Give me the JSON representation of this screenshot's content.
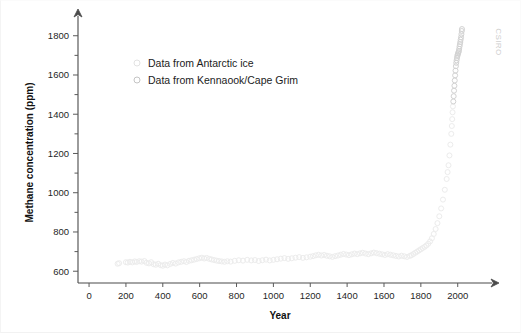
{
  "watermark": {
    "text": "CSIRO"
  },
  "legend": {
    "position": "upper-left-inside",
    "items": [
      {
        "label": "Data from Antarctic ice",
        "marker": "open-circle",
        "color": "#e2e2e2"
      },
      {
        "label": "Data from Kennaook/Cape Grim",
        "marker": "open-circle",
        "color": "#c4c4c4"
      }
    ]
  },
  "chart_data": {
    "type": "scatter",
    "title": "",
    "xlabel": "Year",
    "ylabel": "Methane concentration (ppm)",
    "xlim": [
      -60,
      2110
    ],
    "ylim": [
      540,
      1870
    ],
    "grid": false,
    "xticks": [
      0,
      200,
      400,
      600,
      800,
      1000,
      1200,
      1400,
      1600,
      1800,
      2000
    ],
    "xtick_labels": [
      "0",
      "200",
      "400",
      "600",
      "800",
      "1000",
      "1200",
      "1400",
      "1600",
      "1800",
      "2000"
    ],
    "yticks": [
      600,
      800,
      1000,
      1200,
      1400,
      1600,
      1800
    ],
    "ytick_labels": [
      "600",
      "800",
      "1000",
      "1200",
      "1400",
      "1600",
      "1800"
    ],
    "yminor_ticks": [
      700,
      900,
      1100,
      1300,
      1500,
      1700
    ],
    "axis_arrows": {
      "x": "right",
      "y": "up"
    },
    "series": [
      {
        "name": "Data from Antarctic ice",
        "marker": "open-circle",
        "color": "#ececec",
        "points": [
          [
            155,
            638
          ],
          [
            163,
            641
          ],
          [
            200,
            646
          ],
          [
            210,
            644
          ],
          [
            222,
            648
          ],
          [
            235,
            645
          ],
          [
            248,
            650
          ],
          [
            258,
            647
          ],
          [
            272,
            651
          ],
          [
            285,
            649
          ],
          [
            300,
            652
          ],
          [
            312,
            643
          ],
          [
            325,
            640
          ],
          [
            337,
            646
          ],
          [
            350,
            636
          ],
          [
            362,
            633
          ],
          [
            375,
            638
          ],
          [
            388,
            631
          ],
          [
            400,
            628
          ],
          [
            412,
            634
          ],
          [
            425,
            630
          ],
          [
            440,
            637
          ],
          [
            455,
            642
          ],
          [
            470,
            639
          ],
          [
            485,
            645
          ],
          [
            500,
            648
          ],
          [
            515,
            651
          ],
          [
            528,
            647
          ],
          [
            542,
            653
          ],
          [
            556,
            656
          ],
          [
            570,
            659
          ],
          [
            584,
            662
          ],
          [
            598,
            666
          ],
          [
            612,
            669
          ],
          [
            625,
            665
          ],
          [
            638,
            668
          ],
          [
            652,
            663
          ],
          [
            665,
            660
          ],
          [
            678,
            657
          ],
          [
            692,
            654
          ],
          [
            705,
            652
          ],
          [
            720,
            650
          ],
          [
            735,
            648
          ],
          [
            750,
            651
          ],
          [
            768,
            649
          ],
          [
            790,
            653
          ],
          [
            812,
            656
          ],
          [
            835,
            654
          ],
          [
            858,
            658
          ],
          [
            880,
            655
          ],
          [
            900,
            657
          ],
          [
            920,
            652
          ],
          [
            940,
            656
          ],
          [
            960,
            659
          ],
          [
            980,
            655
          ],
          [
            1000,
            658
          ],
          [
            1020,
            661
          ],
          [
            1040,
            664
          ],
          [
            1060,
            667
          ],
          [
            1080,
            663
          ],
          [
            1100,
            666
          ],
          [
            1120,
            669
          ],
          [
            1140,
            672
          ],
          [
            1160,
            668
          ],
          [
            1180,
            671
          ],
          [
            1200,
            674
          ],
          [
            1215,
            677
          ],
          [
            1230,
            681
          ],
          [
            1245,
            684
          ],
          [
            1260,
            680
          ],
          [
            1275,
            683
          ],
          [
            1290,
            679
          ],
          [
            1305,
            676
          ],
          [
            1320,
            673
          ],
          [
            1335,
            677
          ],
          [
            1350,
            680
          ],
          [
            1365,
            684
          ],
          [
            1380,
            688
          ],
          [
            1395,
            685
          ],
          [
            1410,
            682
          ],
          [
            1425,
            686
          ],
          [
            1440,
            690
          ],
          [
            1455,
            687
          ],
          [
            1470,
            691
          ],
          [
            1485,
            694
          ],
          [
            1500,
            690
          ],
          [
            1515,
            687
          ],
          [
            1530,
            691
          ],
          [
            1545,
            695
          ],
          [
            1560,
            692
          ],
          [
            1575,
            689
          ],
          [
            1590,
            686
          ],
          [
            1605,
            683
          ],
          [
            1620,
            687
          ],
          [
            1635,
            684
          ],
          [
            1650,
            681
          ],
          [
            1665,
            678
          ],
          [
            1680,
            675
          ],
          [
            1695,
            679
          ],
          [
            1710,
            676
          ],
          [
            1725,
            673
          ],
          [
            1740,
            678
          ],
          [
            1750,
            682
          ],
          [
            1760,
            688
          ],
          [
            1770,
            694
          ],
          [
            1780,
            700
          ],
          [
            1790,
            706
          ],
          [
            1800,
            712
          ],
          [
            1810,
            718
          ],
          [
            1820,
            724
          ],
          [
            1830,
            731
          ],
          [
            1840,
            740
          ],
          [
            1850,
            752
          ],
          [
            1860,
            768
          ],
          [
            1870,
            790
          ],
          [
            1880,
            815
          ],
          [
            1890,
            845
          ],
          [
            1900,
            880
          ],
          [
            1910,
            920
          ],
          [
            1920,
            965
          ],
          [
            1930,
            1015
          ],
          [
            1940,
            1070
          ],
          [
            1945,
            1105
          ],
          [
            1950,
            1140
          ],
          [
            1955,
            1190
          ],
          [
            1960,
            1245
          ],
          [
            1965,
            1300
          ],
          [
            1968,
            1340
          ],
          [
            1970,
            1375
          ],
          [
            1972,
            1410
          ],
          [
            1974,
            1440
          ]
        ]
      },
      {
        "name": "Data from Kennaook/Cape Grim",
        "marker": "open-circle",
        "color": "#d2d2d2",
        "points": [
          [
            1976,
            1465
          ],
          [
            1978,
            1492
          ],
          [
            1980,
            1520
          ],
          [
            1982,
            1545
          ],
          [
            1984,
            1572
          ],
          [
            1986,
            1598
          ],
          [
            1988,
            1622
          ],
          [
            1990,
            1645
          ],
          [
            1992,
            1662
          ],
          [
            1994,
            1675
          ],
          [
            1996,
            1687
          ],
          [
            1998,
            1697
          ],
          [
            2000,
            1703
          ],
          [
            2002,
            1710
          ],
          [
            2004,
            1716
          ],
          [
            2006,
            1722
          ],
          [
            2008,
            1733
          ],
          [
            2010,
            1746
          ],
          [
            2012,
            1757
          ],
          [
            2014,
            1768
          ],
          [
            2016,
            1780
          ],
          [
            2018,
            1792
          ],
          [
            2020,
            1808
          ],
          [
            2022,
            1824
          ],
          [
            2023,
            1834
          ]
        ]
      }
    ]
  }
}
